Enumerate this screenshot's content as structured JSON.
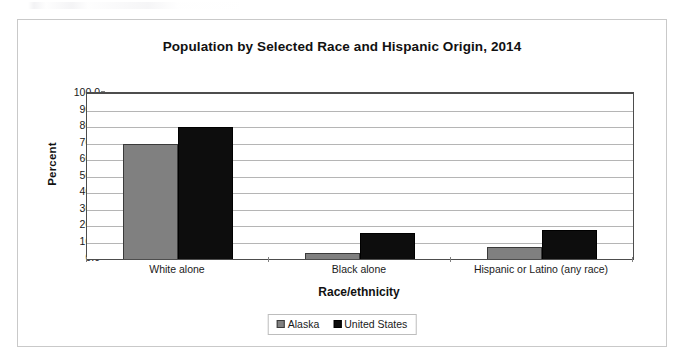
{
  "figure": {
    "frame_border_color": "#c9c9c9",
    "background": "#ffffff"
  },
  "chart_data": {
    "type": "bar",
    "title": "Population by Selected Race and Hispanic Origin, 2014",
    "xlabel": "Race/ethnicity",
    "ylabel": "Percent",
    "categories": [
      "White alone",
      "Black alone",
      "Hispanic or Latino (any race)"
    ],
    "series": [
      {
        "name": "Alaska",
        "color": "#808080",
        "values": [
          69.7,
          3.8,
          7.3
        ]
      },
      {
        "name": "United States",
        "color": "#0d0d0d",
        "values": [
          79.9,
          15.6,
          17.6
        ]
      }
    ],
    "ylim": [
      0.0,
      100.0
    ],
    "ytick_step": 10.0,
    "ytick_labels": [
      "100.0",
      "90.0",
      "80.0",
      "70.0",
      "60.0",
      "50.0",
      "40.0",
      "30.0",
      "20.0",
      "10.0",
      "0.0"
    ],
    "ytick_values": [
      100.0,
      90.0,
      80.0,
      70.0,
      60.0,
      50.0,
      40.0,
      30.0,
      20.0,
      10.0,
      0.0
    ],
    "grid": true,
    "grid_axis": "y",
    "legend_position": "bottom",
    "legend_entries": [
      "Alaska",
      "United States"
    ]
  }
}
